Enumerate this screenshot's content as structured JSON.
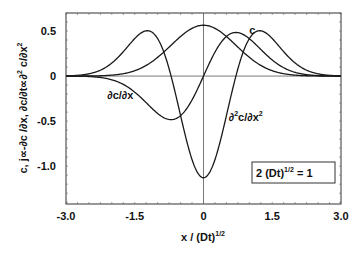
{
  "chart_data": {
    "type": "line",
    "title": "",
    "xlabel": "x / (Dt)",
    "xlabel_sup": "1/2",
    "ylabel": "c,  j∝-∂c /∂x,  ∂c/∂t∝∂",
    "ylabel_parts": [
      "c,  j∝-∂c /∂x,  ∂c/∂t∝∂",
      "2",
      " c/∂x",
      "2"
    ],
    "xlim": [
      -3.0,
      3.0
    ],
    "ylim": [
      -1.42,
      0.7
    ],
    "xticks": [
      -3.0,
      -1.5,
      0,
      1.5,
      3.0
    ],
    "xtick_labels": [
      "-3.0",
      "-1.5",
      "0",
      "1.5",
      "3.0"
    ],
    "yticks": [
      0.5,
      0,
      -0.5,
      -1.0
    ],
    "ytick_labels": [
      "0.5",
      "0",
      "-0.5",
      "-1.0"
    ],
    "grid": false,
    "reference_lines": {
      "x0": true,
      "y0": true
    },
    "annotation": {
      "text": "2 (Dt)",
      "sup": "1/2",
      "tail": " = 1",
      "x": 1.3,
      "y": -1.2
    },
    "x": [
      -3.0,
      -2.75,
      -2.5,
      -2.25,
      -2.0,
      -1.75,
      -1.5,
      -1.25,
      -1.0,
      -0.75,
      -0.5,
      -0.25,
      0.0,
      0.25,
      0.5,
      0.75,
      1.0,
      1.25,
      1.5,
      1.75,
      2.0,
      2.25,
      2.5,
      2.75,
      3.0
    ],
    "series": [
      {
        "name": "c",
        "label": "c",
        "label_pos": [
          1.0,
          0.47
        ],
        "values": [
          0.0001,
          0.0003,
          0.0011,
          0.0036,
          0.0103,
          0.0263,
          0.0595,
          0.1184,
          0.2076,
          0.32,
          0.4394,
          0.5292,
          0.5642,
          0.5292,
          0.4394,
          0.32,
          0.2076,
          0.1184,
          0.0595,
          0.0263,
          0.0103,
          0.0036,
          0.0011,
          0.0003,
          0.0001
        ]
      },
      {
        "name": "j ∝ -∂c/∂x",
        "label": "∂c/∂x",
        "label_pos": [
          -2.1,
          -0.26
        ],
        "values": [
          -0.0007,
          -0.0017,
          -0.0054,
          -0.016,
          -0.0413,
          -0.092,
          -0.1784,
          -0.296,
          -0.4151,
          -0.48,
          -0.4394,
          -0.2646,
          0.0,
          0.2646,
          0.4394,
          0.48,
          0.4151,
          0.296,
          0.1784,
          0.092,
          0.0413,
          0.016,
          0.0054,
          0.0017,
          0.0007
        ]
      },
      {
        "name": "∂²c/∂x²",
        "label": "∂²c/∂x²",
        "label_pos": [
          0.55,
          -0.5
        ],
        "values": [
          0.0038,
          0.008,
          0.0253,
          0.0657,
          0.1441,
          0.2693,
          0.4165,
          0.5032,
          0.4151,
          0.08,
          -0.4394,
          -0.9526,
          -1.1284,
          -0.9526,
          -0.4394,
          0.08,
          0.4151,
          0.5032,
          0.4165,
          0.2693,
          0.1441,
          0.0657,
          0.0253,
          0.008,
          0.0038
        ]
      }
    ],
    "line_color": "#1a1a1a"
  }
}
